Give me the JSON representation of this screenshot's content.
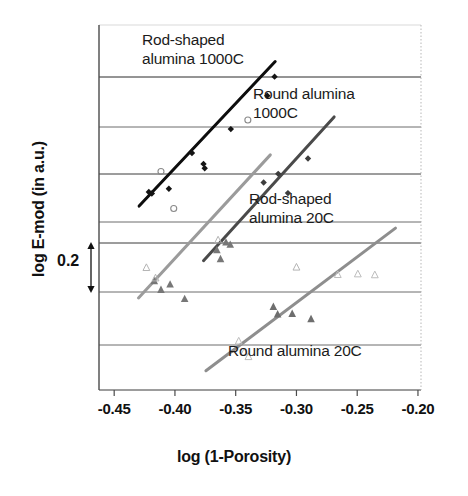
{
  "chart_data": {
    "type": "scatter",
    "title": "",
    "xlabel": "log (1-Porosity)",
    "ylabel": "log E-mod (in a.u.)",
    "xlim": [
      -0.4625,
      -0.1975
    ],
    "xticks": [
      "-0.45",
      "-0.40",
      "-0.35",
      "-0.30",
      "-0.25",
      "-0.20"
    ],
    "xtick_values": [
      -0.45,
      -0.4,
      -0.35,
      -0.3,
      -0.25,
      -0.2
    ],
    "ytick_labels": [],
    "y_scale_bar": "0.2",
    "y_scale_note": "double-headed arrow spanning one gridline interval equals 0.2",
    "grid": "horizontal gridlines only",
    "legend": "inline annotations",
    "annotations": [
      "Rod-shaped\nalumina 1000C",
      "Round alumina\n1000C",
      "Rod-shaped\nalumina 20C",
      "Round alumina 20C"
    ],
    "series": [
      {
        "name": "Rod-shaped alumina 1000C",
        "marker": "filled-diamond",
        "color": "#141414",
        "line_color": "#0d0d0d",
        "fit_line": {
          "x1": -0.4295,
          "y1": 0.1935,
          "x2": -0.3175,
          "y2": 0.833
        },
        "points": [
          {
            "x": -0.4215,
            "y": 0.256
          },
          {
            "x": -0.419,
            "y": 0.249
          },
          {
            "x": -0.405,
            "y": 0.27
          },
          {
            "x": -0.386,
            "y": 0.4285
          },
          {
            "x": -0.3765,
            "y": 0.38
          },
          {
            "x": -0.3755,
            "y": 0.361
          },
          {
            "x": -0.354,
            "y": 0.534
          },
          {
            "x": -0.324,
            "y": 0.6815
          },
          {
            "x": -0.318,
            "y": 0.766
          }
        ]
      },
      {
        "name": "Rod-shaped alumina 1000C (open)",
        "marker": "open-circle",
        "color": "#8a8a8a",
        "points": [
          {
            "x": -0.4115,
            "y": 0.3465
          },
          {
            "x": -0.401,
            "y": 0.183
          },
          {
            "x": -0.34,
            "y": 0.574
          }
        ]
      },
      {
        "name": "Round alumina 1000C",
        "marker": "filled-diamond",
        "color": "#3d3d3d",
        "line_color": "#4a4a4a",
        "fit_line": {
          "x1": -0.3765,
          "y1": -0.048,
          "x2": -0.269,
          "y2": 0.588
        },
        "points": [
          {
            "x": -0.327,
            "y": 0.298
          },
          {
            "x": -0.315,
            "y": 0.336
          },
          {
            "x": -0.307,
            "y": 0.251
          },
          {
            "x": -0.2905,
            "y": 0.404
          }
        ]
      },
      {
        "name": "Rod-shaped alumina 20C",
        "marker": "filled-triangle",
        "color": "#777777",
        "line_color": "#9b9b9b",
        "fit_line": {
          "x1": -0.43,
          "y1": -0.213,
          "x2": -0.3215,
          "y2": 0.42
        },
        "points": [
          {
            "x": -0.417,
            "y": -0.137
          },
          {
            "x": -0.4115,
            "y": -0.176
          },
          {
            "x": -0.404,
            "y": -0.152
          },
          {
            "x": -0.392,
            "y": -0.216
          },
          {
            "x": -0.3655,
            "y": 0.0
          },
          {
            "x": -0.3625,
            "y": -0.04
          },
          {
            "x": -0.358,
            "y": 0.034
          },
          {
            "x": -0.3545,
            "y": 0.024
          }
        ]
      },
      {
        "name": "Rod-shaped alumina 20C (open)",
        "marker": "open-triangle",
        "color": "#b4b4b4",
        "points": [
          {
            "x": -0.4235,
            "y": -0.078
          },
          {
            "x": -0.416,
            "y": -0.124
          },
          {
            "x": -0.3645,
            "y": 0.044
          },
          {
            "x": -0.3,
            "y": -0.076
          }
        ]
      },
      {
        "name": "Round alumina 20C",
        "marker": "filled-triangle",
        "color": "#6e6e6e",
        "line_color": "#8e8e8e",
        "fit_line": {
          "x1": -0.3745,
          "y1": -0.535,
          "x2": -0.2185,
          "y2": 0.096
        },
        "points": [
          {
            "x": -0.319,
            "y": -0.251
          },
          {
            "x": -0.3155,
            "y": -0.284
          },
          {
            "x": -0.3035,
            "y": -0.282
          },
          {
            "x": -0.288,
            "y": -0.305
          }
        ]
      },
      {
        "name": "Round alumina 20C (open)",
        "marker": "open-triangle",
        "color": "#bdbdbd",
        "points": [
          {
            "x": -0.3475,
            "y": -0.403
          },
          {
            "x": -0.343,
            "y": -0.452
          },
          {
            "x": -0.3395,
            "y": -0.472
          },
          {
            "x": -0.266,
            "y": -0.109
          },
          {
            "x": -0.2495,
            "y": -0.106
          },
          {
            "x": -0.2355,
            "y": -0.11
          }
        ]
      }
    ]
  },
  "annotations": {
    "rod_1000": "Rod-shaped\nalumina 1000C",
    "round_1000": "Round alumina\n1000C",
    "rod_20": "Rod-shaped\nalumina 20C",
    "round_20": "Round alumina 20C"
  },
  "axes": {
    "x_title": "log (1-Porosity)",
    "y_title": "log E-mod (in a.u.)",
    "scale_bar_label": "0.2",
    "xticks": [
      "-0.45",
      "-0.40",
      "-0.35",
      "-0.30",
      "-0.25",
      "-0.20"
    ]
  }
}
